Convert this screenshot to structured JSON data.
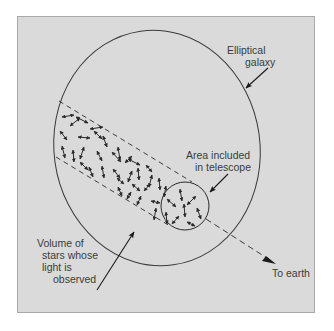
{
  "figure": {
    "labels": {
      "galaxy_line1": "Elliptical",
      "galaxy_line2": "galaxy",
      "telescope_line1": "Area included",
      "telescope_line2": "in telescope",
      "volume_line1": "Volume of",
      "volume_line2": "stars whose",
      "volume_line3": "light is",
      "volume_line4": "observed",
      "earth": "To earth"
    },
    "elements": {
      "galaxy": "elliptical-galaxy-outline",
      "band": "line-of-sight-column-dashed",
      "aperture": "telescope-aperture-circle",
      "stars": "star-velocity-arrows",
      "pointer": "direction-to-earth-arrow"
    },
    "colors": {
      "background": "#ffffff",
      "panel": "#dadada",
      "panel_border": "#a8a8a8",
      "ink": "#2a2a2a",
      "text": "#3a3a3a"
    }
  }
}
